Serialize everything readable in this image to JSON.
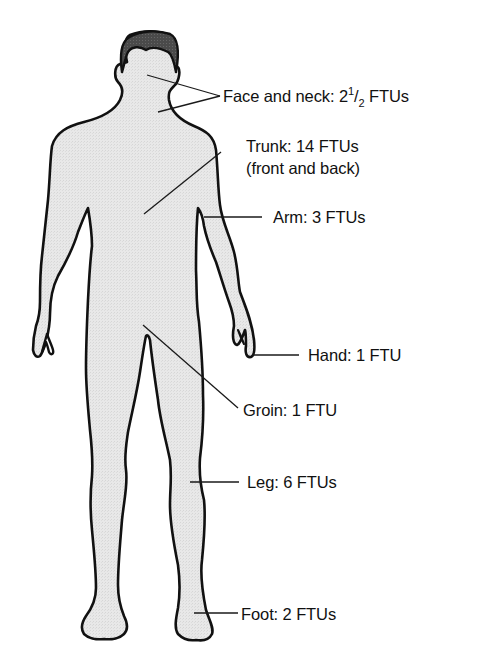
{
  "diagram": {
    "colors": {
      "body_fill": "#e6e6e6",
      "hair_fill": "#4a4a4a",
      "outline": "#111111",
      "leader_line": "#1a1a1a",
      "text": "#111111",
      "background": "#ffffff"
    },
    "labels": [
      {
        "id": "face-neck",
        "region": "Face and neck",
        "prefix": "Face and neck: 2",
        "fraction_numerator": "1",
        "fraction_slash": "/",
        "fraction_denominator": "2",
        "suffix": " FTUs",
        "value": "2 1/2 FTUs"
      },
      {
        "id": "trunk",
        "region": "Trunk",
        "line1": "Trunk: 14 FTUs",
        "line2": "(front and back)",
        "value": "14 FTUs"
      },
      {
        "id": "arm",
        "region": "Arm",
        "text": "Arm: 3 FTUs",
        "value": "3 FTUs"
      },
      {
        "id": "hand",
        "region": "Hand",
        "text": "Hand: 1 FTU",
        "value": "1 FTU"
      },
      {
        "id": "groin",
        "region": "Groin",
        "text": "Groin: 1 FTU",
        "value": "1 FTU"
      },
      {
        "id": "leg",
        "region": "Leg",
        "text": "Leg: 6 FTUs",
        "value": "6 FTUs"
      },
      {
        "id": "foot",
        "region": "Foot",
        "text": "Foot: 2 FTUs",
        "value": "2 FTUs"
      }
    ]
  }
}
